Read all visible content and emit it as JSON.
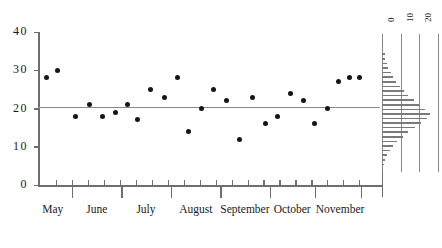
{
  "chart_data": {
    "type": "scatter",
    "title": "",
    "xlabel": "",
    "ylabel": "",
    "ylim": [
      0,
      40
    ],
    "yticks": [
      0,
      10,
      20,
      30,
      40
    ],
    "ytick_labels": [
      "0",
      "10",
      "20",
      "30",
      "40"
    ],
    "grid": false,
    "legend": "none",
    "categories": [
      "May",
      "June",
      "July",
      "August",
      "September",
      "October",
      "November"
    ],
    "xtick_labels": [
      "May",
      "June",
      "July",
      "August",
      "September",
      "October",
      "November"
    ],
    "reference_line": {
      "orientation": "horizontal",
      "value": 20.5,
      "label": ""
    },
    "points": [
      {
        "x": 0.2,
        "y": 28
      },
      {
        "x": 0.55,
        "y": 30
      },
      {
        "x": 1.1,
        "y": 18
      },
      {
        "x": 1.55,
        "y": 21
      },
      {
        "x": 1.95,
        "y": 18
      },
      {
        "x": 2.35,
        "y": 19
      },
      {
        "x": 2.75,
        "y": 21
      },
      {
        "x": 3.05,
        "y": 17
      },
      {
        "x": 3.45,
        "y": 25
      },
      {
        "x": 3.9,
        "y": 23
      },
      {
        "x": 4.3,
        "y": 28
      },
      {
        "x": 4.65,
        "y": 14
      },
      {
        "x": 5.05,
        "y": 20
      },
      {
        "x": 5.45,
        "y": 25
      },
      {
        "x": 5.85,
        "y": 22
      },
      {
        "x": 6.25,
        "y": 12
      },
      {
        "x": 6.65,
        "y": 23
      },
      {
        "x": 7.05,
        "y": 16
      },
      {
        "x": 7.45,
        "y": 18
      },
      {
        "x": 7.85,
        "y": 24
      },
      {
        "x": 8.25,
        "y": 22
      },
      {
        "x": 8.6,
        "y": 16
      },
      {
        "x": 9.0,
        "y": 20
      },
      {
        "x": 9.35,
        "y": 27
      },
      {
        "x": 9.7,
        "y": 28
      },
      {
        "x": 10.0,
        "y": 28
      }
    ],
    "marginal_histogram": {
      "type": "bar",
      "orientation": "horizontal",
      "position": "right",
      "xtick_labels": [
        "0",
        "10",
        "20",
        "30"
      ],
      "gridlines": 4,
      "bins": [
        {
          "y": 38.0,
          "count": 0.4
        },
        {
          "y": 36.8,
          "count": 0.6
        },
        {
          "y": 35.6,
          "count": 0.8
        },
        {
          "y": 34.4,
          "count": 1.4
        },
        {
          "y": 33.2,
          "count": 1.8
        },
        {
          "y": 32.0,
          "count": 2.6
        },
        {
          "y": 30.8,
          "count": 3.4
        },
        {
          "y": 29.6,
          "count": 4.6
        },
        {
          "y": 28.4,
          "count": 6.0
        },
        {
          "y": 27.2,
          "count": 7.6
        },
        {
          "y": 26.0,
          "count": 9.4
        },
        {
          "y": 24.8,
          "count": 11.6
        },
        {
          "y": 23.6,
          "count": 14.0
        },
        {
          "y": 22.4,
          "count": 17.0
        },
        {
          "y": 21.2,
          "count": 20.0
        },
        {
          "y": 20.0,
          "count": 23.0
        },
        {
          "y": 18.8,
          "count": 25.5
        },
        {
          "y": 17.6,
          "count": 24.0
        },
        {
          "y": 16.4,
          "count": 21.0
        },
        {
          "y": 15.2,
          "count": 17.5
        },
        {
          "y": 14.0,
          "count": 14.0
        },
        {
          "y": 12.8,
          "count": 11.0
        },
        {
          "y": 11.6,
          "count": 8.0
        },
        {
          "y": 10.4,
          "count": 6.0
        },
        {
          "y": 9.2,
          "count": 4.2
        },
        {
          "y": 8.0,
          "count": 2.8
        },
        {
          "y": 6.8,
          "count": 1.8
        },
        {
          "y": 5.6,
          "count": 1.0
        },
        {
          "y": 4.4,
          "count": 0.5
        }
      ]
    }
  }
}
